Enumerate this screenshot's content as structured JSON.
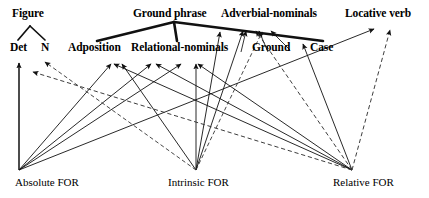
{
  "diagram": {
    "tiers": {
      "tier1": [
        {
          "id": "figure",
          "label": "Figure",
          "x": 12,
          "y": 8
        },
        {
          "id": "ground-phrase",
          "label": "Ground phrase",
          "x": 133,
          "y": 8
        },
        {
          "id": "adverbial-nominals",
          "label": "Adverbial-nominals",
          "x": 221,
          "y": 8
        },
        {
          "id": "locative-verb",
          "label": "Locative verb",
          "x": 345,
          "y": 8
        }
      ],
      "tier2": [
        {
          "id": "det",
          "label": "Det",
          "x": 10,
          "y": 42
        },
        {
          "id": "n",
          "label": "N",
          "x": 41,
          "y": 42
        },
        {
          "id": "adposition",
          "label": "Adposition",
          "x": 68,
          "y": 42
        },
        {
          "id": "relational-nominals",
          "label": "Relational-nominals",
          "x": 131,
          "y": 42
        },
        {
          "id": "ground",
          "label": "Ground",
          "x": 252,
          "y": 42
        },
        {
          "id": "case",
          "label": "Case",
          "x": 310,
          "y": 42
        }
      ],
      "tier3": [
        {
          "id": "absolute-for",
          "label": "Absolute FOR",
          "x": 15,
          "y": 177
        },
        {
          "id": "intrinsic-for",
          "label": "Intrinsic FOR",
          "x": 168,
          "y": 177
        },
        {
          "id": "relative-for",
          "label": "Relative FOR",
          "x": 333,
          "y": 177
        }
      ]
    },
    "hubs": {
      "absolute": {
        "x": 19,
        "y": 170
      },
      "intrinsic": {
        "x": 196,
        "y": 170
      },
      "relative": {
        "x": 352,
        "y": 170
      }
    },
    "tree": {
      "figure_node": {
        "x": 30,
        "y": 26
      },
      "figure_children": [
        {
          "x": 18,
          "y": 40
        },
        {
          "x": 44,
          "y": 40
        }
      ],
      "ground_phrase_node": {
        "x": 174,
        "y": 22
      },
      "ground_phrase_children": [
        {
          "x": 98,
          "y": 40
        },
        {
          "x": 176,
          "y": 40
        },
        {
          "x": 322,
          "y": 40
        }
      ]
    },
    "colors": {
      "ink": "#000000",
      "background": "#ffffff",
      "solid_edge": "#1a1a1a",
      "dashed_edge": "#4d4d4d"
    },
    "edge_styles": {
      "solid": "solid",
      "dashed": "dashed",
      "thick_tree": "thick"
    },
    "edges": [
      {
        "from": "absolute-for",
        "to": "det",
        "style": "solid",
        "note": "vertical inheritance link"
      },
      {
        "from": "absolute-for",
        "to": "adposition",
        "style": "solid"
      },
      {
        "from": "absolute-for",
        "to": "relational-nominals",
        "style": "solid"
      },
      {
        "from": "absolute-for",
        "to": "adverbial-nominals",
        "style": "solid"
      },
      {
        "from": "absolute-for",
        "to": "locative-verb",
        "style": "solid"
      },
      {
        "from": "intrinsic-for",
        "to": "adposition",
        "style": "solid"
      },
      {
        "from": "intrinsic-for",
        "to": "relational-nominals",
        "style": "solid"
      },
      {
        "from": "intrinsic-for",
        "to": "adverbial-nominals",
        "style": "solid"
      },
      {
        "from": "intrinsic-for",
        "to": "n",
        "style": "dashed"
      },
      {
        "from": "intrinsic-for",
        "to": "adverbial-nominals-2",
        "style": "dashed"
      },
      {
        "from": "relative-for",
        "to": "adposition",
        "style": "solid"
      },
      {
        "from": "relative-for",
        "to": "relational-nominals",
        "style": "solid"
      },
      {
        "from": "relative-for",
        "to": "case",
        "style": "solid"
      },
      {
        "from": "relative-for",
        "to": "det",
        "style": "dashed"
      },
      {
        "from": "relative-for",
        "to": "locative-verb",
        "style": "dashed"
      },
      {
        "from": "relative-for",
        "to": "adverbial-nominals",
        "style": "dashed"
      }
    ]
  }
}
